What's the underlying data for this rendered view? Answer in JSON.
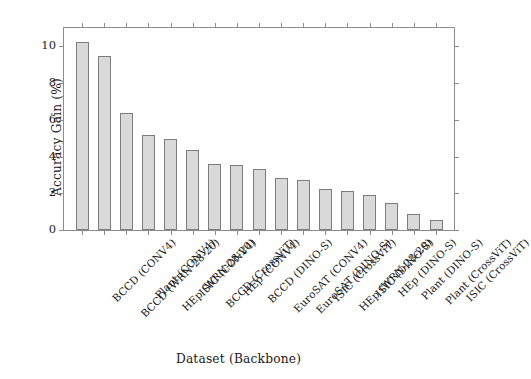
{
  "chart_data": {
    "type": "bar",
    "title": "",
    "xlabel": "Dataset (Backbone)",
    "ylabel": "Accuracy Gain (%)",
    "ylim": [
      0,
      11
    ],
    "yticks": [
      0,
      2,
      4,
      6,
      8,
      10
    ],
    "ytick_labels": [
      "0",
      "2",
      "4",
      "6",
      "8",
      "10"
    ],
    "grid": false,
    "legend": null,
    "bar_color": "#d9d9d9",
    "bar_edge_color": "#7d7d7d",
    "categories": [
      "BCCD (CONV4)",
      "BCCD (WRN-28-20)",
      "Plant (CONV4)",
      "HEp (WRN-28-20)",
      "ISIC (CONV4)",
      "BCCD (CrossViT)",
      "HEp (CONV4)",
      "BCCD (DINO-S)",
      "EuroSAT (CONV4)",
      "EuroSAT (DINO-S)",
      "ISIC (CrossViT)",
      "HEp (WRN-28-20)",
      "ISIC (DINO-S)",
      "HEp (DINO-S)",
      "Plant (DINO-S)",
      "Plant (CrossViT)",
      "ISIC (CrossViT)"
    ],
    "values": [
      10.25,
      9.45,
      6.35,
      5.15,
      4.95,
      4.35,
      3.6,
      3.55,
      3.3,
      2.85,
      2.7,
      2.25,
      2.15,
      1.9,
      1.45,
      0.85,
      0.55
    ]
  }
}
